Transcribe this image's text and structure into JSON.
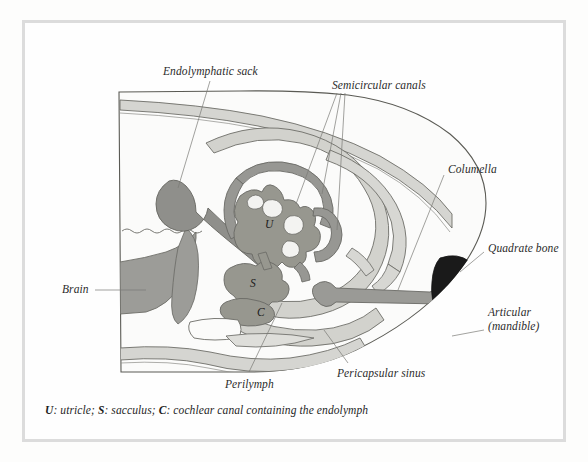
{
  "figure": {
    "kind": "anatomical-cross-section",
    "caption_prefix_u": "U",
    "caption_u_text": ": utricle; ",
    "caption_prefix_s": "S",
    "caption_s_text": ": sacculus; ",
    "caption_prefix_c": "C",
    "caption_c_text": ": cochlear canal containing the endolymph"
  },
  "labels": {
    "endolymphatic_sack": "Endolymphatic sack",
    "semicircular_canals": "Semicircular canals",
    "columella": "Columella",
    "quadrate_bone": "Quadrate bone",
    "articular_line1": "Articular",
    "articular_line2": "(mandible)",
    "brain": "Brain",
    "perilymph": "Perilymph",
    "pericapsular_sinus": "Pericapsular sinus"
  },
  "organ_letters": {
    "utricle": "U",
    "sacculus": "S",
    "cochlear_canal": "C"
  },
  "colors": {
    "frame_border": "#dcdcdc",
    "page_background": "#fefefe",
    "outline_stroke": "#5a5a54",
    "head_fill": "#fbfbfa",
    "tissue_light": "#e2e2df",
    "tissue_mid": "#cfcfca",
    "membrane_gray": "#9a9a96",
    "membrane_gray_dark": "#8e8e8a",
    "quadrate_black": "#1a1a1a",
    "articular_fill": "#e6e6e3",
    "leader_line": "#7a7a76",
    "text": "#2b2b2b"
  }
}
